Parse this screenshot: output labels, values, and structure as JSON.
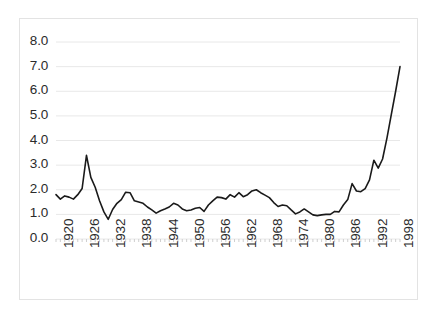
{
  "chart_data": {
    "type": "line",
    "title": "",
    "subtitle": "",
    "xlabel": "",
    "ylabel": "",
    "xlim": [
      1920,
      1999
    ],
    "ylim": [
      0.0,
      8.0
    ],
    "grid": "horizontal",
    "legend": "none",
    "series_color": "#1a1a1a",
    "y_ticks": [
      "0.0",
      "1.0",
      "2.0",
      "3.0",
      "4.0",
      "5.0",
      "6.0",
      "7.0",
      "8.0"
    ],
    "y_tick_values": [
      0,
      1,
      2,
      3,
      4,
      5,
      6,
      7,
      8
    ],
    "x_ticks": [
      "1920",
      "1926",
      "1932",
      "1938",
      "1944",
      "1950",
      "1956",
      "1962",
      "1968",
      "1974",
      "1980",
      "1986",
      "1992",
      "1998"
    ],
    "x_tick_values": [
      1920,
      1926,
      1932,
      1938,
      1944,
      1950,
      1956,
      1962,
      1968,
      1974,
      1980,
      1986,
      1992,
      1998
    ],
    "series": [
      {
        "name": "value",
        "x": [
          1920,
          1921,
          1922,
          1923,
          1924,
          1925,
          1926,
          1927,
          1928,
          1929,
          1930,
          1931,
          1932,
          1933,
          1934,
          1935,
          1936,
          1937,
          1938,
          1939,
          1940,
          1941,
          1942,
          1943,
          1944,
          1945,
          1946,
          1947,
          1948,
          1949,
          1950,
          1951,
          1952,
          1953,
          1954,
          1955,
          1956,
          1957,
          1958,
          1959,
          1960,
          1961,
          1962,
          1963,
          1964,
          1965,
          1966,
          1967,
          1968,
          1969,
          1970,
          1971,
          1972,
          1973,
          1974,
          1975,
          1976,
          1977,
          1978,
          1979,
          1980,
          1981,
          1982,
          1983,
          1984,
          1985,
          1986,
          1987,
          1988,
          1989,
          1990,
          1991,
          1992,
          1993,
          1994,
          1995,
          1996,
          1997,
          1998,
          1999
        ],
        "values": [
          1.8,
          1.62,
          1.75,
          1.7,
          1.62,
          1.8,
          2.05,
          3.4,
          2.5,
          2.1,
          1.55,
          1.1,
          0.8,
          1.2,
          1.45,
          1.6,
          1.9,
          1.88,
          1.55,
          1.5,
          1.45,
          1.3,
          1.18,
          1.05,
          1.15,
          1.22,
          1.3,
          1.45,
          1.38,
          1.22,
          1.15,
          1.18,
          1.25,
          1.28,
          1.12,
          1.38,
          1.55,
          1.7,
          1.68,
          1.62,
          1.8,
          1.7,
          1.88,
          1.72,
          1.8,
          1.95,
          2.0,
          1.88,
          1.78,
          1.68,
          1.48,
          1.32,
          1.38,
          1.35,
          1.18,
          1.02,
          1.1,
          1.22,
          1.1,
          0.98,
          0.95,
          0.98,
          1.0,
          1.0,
          1.12,
          1.1,
          1.38,
          1.6,
          2.25,
          1.95,
          1.92,
          2.05,
          2.4,
          3.2,
          2.88,
          3.25,
          4.1,
          5.05,
          6.0,
          7.0
        ]
      }
    ]
  }
}
